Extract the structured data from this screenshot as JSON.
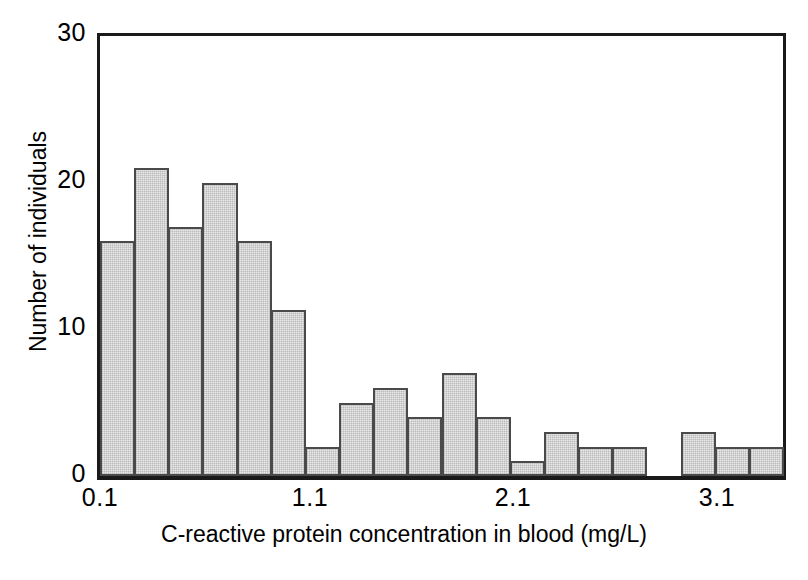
{
  "chart_data": {
    "type": "bar",
    "title": "",
    "subtitle": "",
    "xlabel": "C-reactive protein concentration in blood (mg/L)",
    "ylabel": "Number of individuals",
    "ylim": [
      0,
      30
    ],
    "xlim": [
      0.1,
      3.4333
    ],
    "grid": false,
    "legend": null,
    "bin_width": 0.1667,
    "y_ticks": [
      0,
      10,
      20,
      30
    ],
    "y_tick_labels": [
      "0",
      "10",
      "20",
      "30"
    ],
    "x_ticks": [
      0.1,
      1.1,
      2.1,
      3.1
    ],
    "x_tick_labels": [
      "0.1",
      "1.1",
      "2.1",
      "3.1"
    ],
    "bar_fill_color": "#e9e9e9",
    "bar_edge_color": "#4a4a4a",
    "axis_color": "#1a1a1a",
    "background_color": "#ffffff",
    "categories": [
      "0.100",
      "0.267",
      "0.433",
      "0.600",
      "0.767",
      "0.933",
      "1.100",
      "1.267",
      "1.433",
      "1.600",
      "1.767",
      "1.933",
      "2.100",
      "2.267",
      "2.433",
      "2.600",
      "2.767",
      "2.933",
      "3.100",
      "3.267"
    ],
    "bin_starts": [
      0.1,
      0.267,
      0.433,
      0.6,
      0.767,
      0.933,
      1.1,
      1.267,
      1.433,
      1.6,
      1.767,
      1.933,
      2.1,
      2.267,
      2.433,
      2.6,
      2.767,
      2.933,
      3.1,
      3.267
    ],
    "values": [
      16,
      21,
      17,
      20,
      16,
      11.3,
      2,
      5,
      6,
      4,
      7,
      4,
      1,
      3,
      2,
      2,
      0,
      3,
      2,
      2
    ]
  },
  "axes": {
    "y_title": "Number of individuals",
    "x_title": "C-reactive protein concentration in blood (mg/L)",
    "y_labels": [
      "30",
      "20",
      "10",
      "0"
    ],
    "x_labels": [
      "0.1",
      "1.1",
      "2.1",
      "3.1"
    ]
  }
}
